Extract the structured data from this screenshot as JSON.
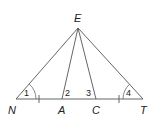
{
  "diagram": {
    "type": "geometry-triangle",
    "points": {
      "E": {
        "label": "E",
        "x": 78,
        "y": 28
      },
      "N": {
        "label": "N",
        "x": 16,
        "y": 99
      },
      "A": {
        "label": "A",
        "x": 62,
        "y": 99
      },
      "C": {
        "label": "C",
        "x": 96,
        "y": 99
      },
      "T": {
        "label": "T",
        "x": 143,
        "y": 99
      }
    },
    "segments": [
      "EN",
      "EA",
      "EC",
      "ET",
      "NT"
    ],
    "angles": [
      {
        "label": "1",
        "vertex": "N"
      },
      {
        "label": "2",
        "vertex": "A"
      },
      {
        "label": "3",
        "vertex": "C"
      },
      {
        "label": "4",
        "vertex": "T"
      }
    ],
    "congruence_ticks": [
      "NA",
      "CT"
    ],
    "colors": {
      "line": "#555555",
      "text": "#222222",
      "background": "#ffffff"
    }
  }
}
